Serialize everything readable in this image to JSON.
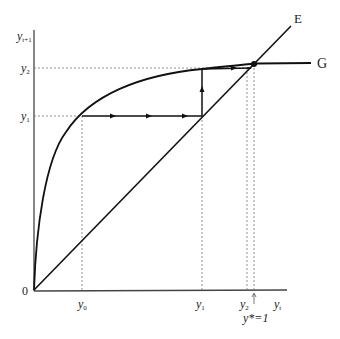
{
  "diagram": {
    "title": "",
    "axes": {
      "y_label": "y",
      "y_label_sub": "t+1",
      "x_label": "y",
      "x_label_sub": "t",
      "origin": "0"
    },
    "curves": {
      "line_E": "E",
      "curve_G": "G"
    },
    "y_ticks": [
      {
        "name": "y",
        "sub": "2"
      },
      {
        "name": "y",
        "sub": "1"
      }
    ],
    "x_ticks": [
      {
        "name": "y",
        "sub": "0"
      },
      {
        "name": "y",
        "sub": "1"
      },
      {
        "name": "y",
        "sub": "2"
      }
    ],
    "steady_state_label": "y*=1",
    "colors": {
      "line": "#111111",
      "guide": "#666666"
    }
  }
}
